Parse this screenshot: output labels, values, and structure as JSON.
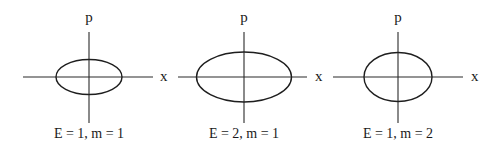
{
  "diagram": {
    "type": "phase-space orbits (ellipses)",
    "panels": [
      {
        "id": "panel-1",
        "caption": "E = 1, m = 1",
        "x_axis_label": "x",
        "y_axis_label": "p",
        "E": 1,
        "m": 1,
        "geometry": {
          "cx": 89,
          "cy": 77,
          "rx": 33,
          "ry": 17.5,
          "h_from": 23,
          "h_to": 153,
          "v_from": 32,
          "v_to": 123,
          "x_label_x": 163,
          "p_label_y": 22,
          "caption_x": 89
        }
      },
      {
        "id": "panel-2",
        "caption": "E = 2, m = 1",
        "x_axis_label": "x",
        "y_axis_label": "p",
        "E": 2,
        "m": 1,
        "geometry": {
          "cx": 244,
          "cy": 77,
          "rx": 47.5,
          "ry": 25,
          "h_from": 178,
          "h_to": 307,
          "v_from": 32,
          "v_to": 123,
          "x_label_x": 318,
          "p_label_y": 22,
          "caption_x": 244
        }
      },
      {
        "id": "panel-3",
        "caption": "E = 1, m = 2",
        "x_axis_label": "x",
        "y_axis_label": "p",
        "E": 1,
        "m": 2,
        "geometry": {
          "cx": 398,
          "cy": 77,
          "rx": 34,
          "ry": 24.5,
          "h_from": 333,
          "h_to": 463,
          "v_from": 32,
          "v_to": 123,
          "x_label_x": 474,
          "p_label_y": 22,
          "caption_x": 398
        }
      }
    ]
  }
}
